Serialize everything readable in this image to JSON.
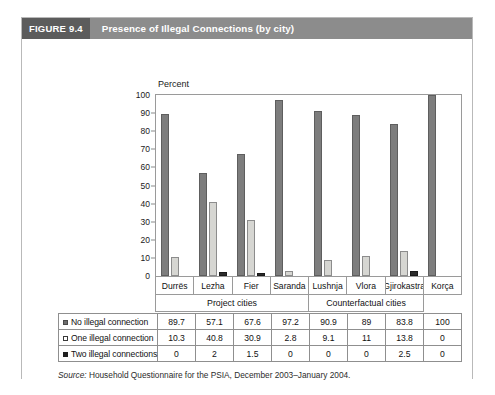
{
  "figure": {
    "badge": "FIGURE 9.4",
    "title": "Presence of Illegal Connections (by city)",
    "source_prefix": "Source:",
    "source_text": " Household Questionnaire for the PSIA, December 2003–January 2004."
  },
  "colors": {
    "header_bar": "#8c8c8c",
    "badge": "#5c5c5c",
    "series_no_illegal": "#7d7d7d",
    "series_one_illegal": "#d6d6d2",
    "series_two_illegal": "#2b2b2b",
    "border": "#9a9a9a"
  },
  "chart_data": {
    "type": "bar",
    "title": "Presence of Illegal Connections (by city)",
    "xlabel": "",
    "ylabel": "Percent",
    "ylim": [
      0,
      100
    ],
    "yticks": [
      0,
      10,
      20,
      30,
      40,
      50,
      60,
      70,
      80,
      90,
      100
    ],
    "grid": false,
    "legend": "table",
    "categories": [
      "Durrës",
      "Lezha",
      "Fier",
      "Saranda",
      "Lushnja",
      "Vlora",
      "Gjirokastra",
      "Korça"
    ],
    "category_groups": [
      {
        "label": "Project cities",
        "span": 4
      },
      {
        "label": "Counterfactual cities",
        "span": 3
      },
      {
        "label": "",
        "span": 1
      }
    ],
    "series": [
      {
        "name": "No illegal connection",
        "values": [
          89.7,
          57.1,
          67.6,
          97.2,
          90.9,
          89,
          83.8,
          100
        ]
      },
      {
        "name": "One illegal connection",
        "values": [
          10.3,
          40.8,
          30.9,
          2.8,
          9.1,
          11,
          13.8,
          0
        ]
      },
      {
        "name": "Two illegal connections",
        "values": [
          0,
          2,
          1.5,
          0,
          0,
          0,
          2.5,
          0
        ]
      }
    ]
  },
  "table": {
    "rows": [
      {
        "label": "No illegal connection",
        "values": [
          "89.7",
          "57.1",
          "67.6",
          "97.2",
          "90.9",
          "89",
          "83.8",
          "100"
        ]
      },
      {
        "label": "One illegal connection",
        "values": [
          "10.3",
          "40.8",
          "30.9",
          "2.8",
          "9.1",
          "11",
          "13.8",
          "0"
        ]
      },
      {
        "label": "Two illegal connections",
        "values": [
          "0",
          "2",
          "1.5",
          "0",
          "0",
          "0",
          "2.5",
          "0"
        ]
      }
    ]
  }
}
